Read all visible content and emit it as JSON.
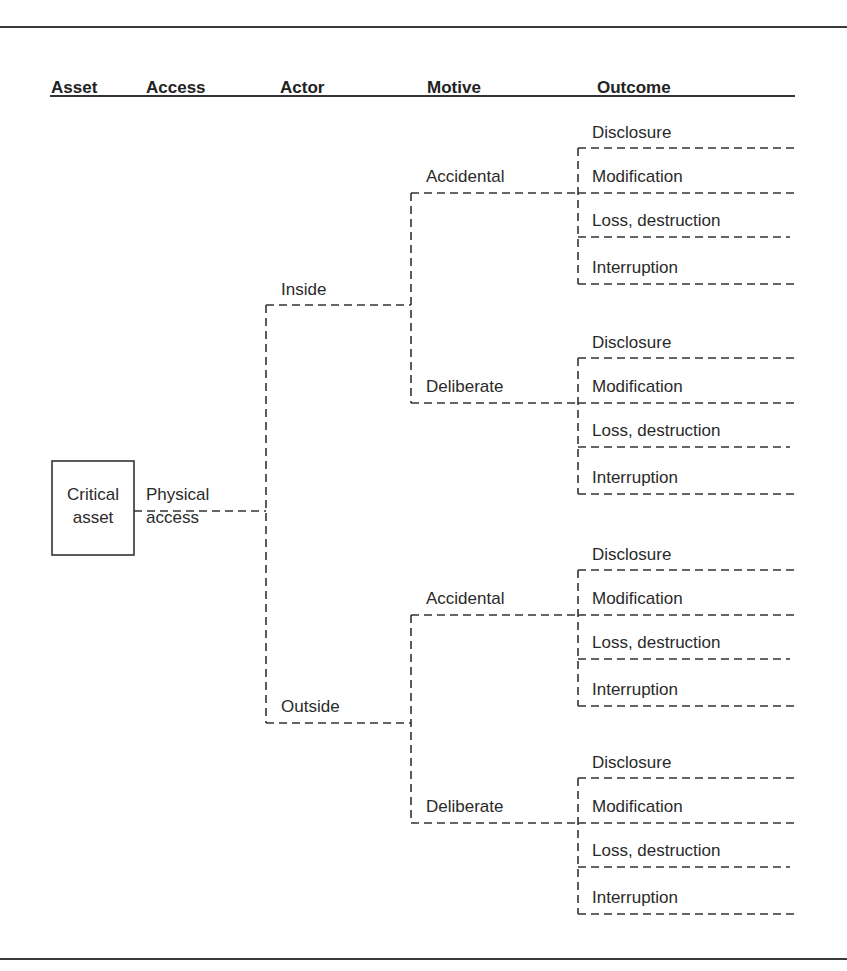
{
  "headers": {
    "asset": "Asset",
    "access": "Access",
    "actor": "Actor",
    "motive": "Motive",
    "outcome": "Outcome"
  },
  "asset": {
    "line1": "Critical",
    "line2": "asset"
  },
  "access": {
    "line1": "Physical",
    "line2": "access"
  },
  "actors": [
    "Inside",
    "Outside"
  ],
  "motives": [
    "Accidental",
    "Deliberate",
    "Accidental",
    "Deliberate"
  ],
  "outcomes": [
    "Disclosure",
    "Modification",
    "Loss, destruction",
    "Interruption"
  ],
  "tree": {
    "Critical asset": {
      "Physical access": {
        "Inside": {
          "Accidental": [
            "Disclosure",
            "Modification",
            "Loss, destruction",
            "Interruption"
          ],
          "Deliberate": [
            "Disclosure",
            "Modification",
            "Loss, destruction",
            "Interruption"
          ]
        },
        "Outside": {
          "Accidental": [
            "Disclosure",
            "Modification",
            "Loss, destruction",
            "Interruption"
          ],
          "Deliberate": [
            "Disclosure",
            "Modification",
            "Loss, destruction",
            "Interruption"
          ]
        }
      }
    }
  }
}
